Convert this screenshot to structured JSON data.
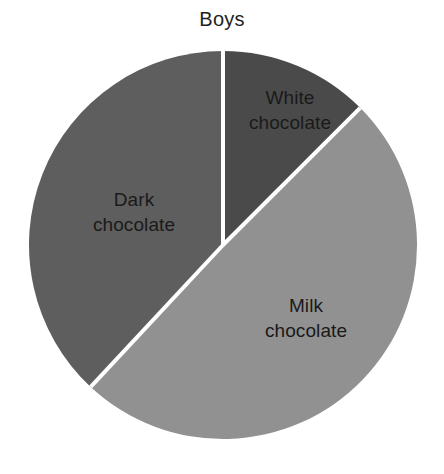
{
  "chart_data": {
    "type": "pie",
    "title": "Boys",
    "subtitle": "",
    "xlabel": "",
    "ylabel": "",
    "grid": false,
    "legend_position": "none",
    "label_placement": "inside-slice",
    "start_angle_deg": 0,
    "direction": "clockwise",
    "categories": [
      "White chocolate",
      "Milk chocolate",
      "Dark chocolate"
    ],
    "values": [
      12.5,
      49.5,
      38
    ],
    "slices": [
      {
        "name": "White chocolate",
        "label_line1": "White",
        "label_line2": "chocolate",
        "value": 12.5,
        "start_angle_deg": 0,
        "end_angle_deg": 45,
        "color": "#4a4a4a"
      },
      {
        "name": "Milk chocolate",
        "label_line1": "Milk",
        "label_line2": "chocolate",
        "value": 49.5,
        "start_angle_deg": 45,
        "end_angle_deg": 223,
        "color": "#919191"
      },
      {
        "name": "Dark chocolate",
        "label_line1": "Dark",
        "label_line2": "chocolate",
        "value": 38,
        "start_angle_deg": 223,
        "end_angle_deg": 360,
        "color": "#5e5e5e"
      }
    ],
    "geometry": {
      "center_x": 223,
      "center_y": 245,
      "radius": 194,
      "divider_color": "#ffffff",
      "divider_width": 4
    },
    "background_color": "#ffffff",
    "title_color": "#231f20",
    "label_color": "#1a1a1a"
  },
  "labels": {
    "white_chocolate": "White\nchocolate",
    "dark_chocolate": "Dark\nchocolate",
    "milk_chocolate": "Milk\nchocolate"
  }
}
